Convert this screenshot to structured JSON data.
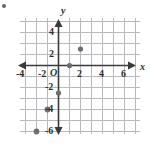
{
  "chart_data": {
    "type": "scatter",
    "title": "",
    "xlabel": "x",
    "ylabel": "y",
    "grid": true,
    "legend": false,
    "xlim": [
      -5,
      7
    ],
    "ylim": [
      -7,
      5
    ],
    "xticks": [
      -4,
      -2,
      2,
      4,
      6
    ],
    "yticks": [
      4,
      2,
      -2,
      -4,
      -6
    ],
    "xtick_labels": [
      "-4",
      "-2",
      "2",
      "4",
      "6"
    ],
    "ytick_labels": [
      "4",
      "2",
      "-2",
      "-4",
      "-6"
    ],
    "origin_label": "O",
    "points": [
      {
        "x": 2,
        "y": 1.5
      },
      {
        "x": 1,
        "y": 0
      },
      {
        "x": 0,
        "y": -2.5
      },
      {
        "x": -1,
        "y": -4
      },
      {
        "x": -2,
        "y": -6
      }
    ],
    "point_color": "#6d6d72",
    "axis_color": "#3a3a3a",
    "grid_color": "#b9b9bd"
  }
}
